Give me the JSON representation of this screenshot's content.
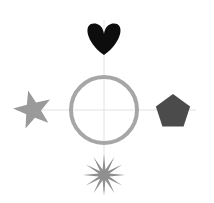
{
  "canvas": {
    "width": 214,
    "height": 203,
    "background": "#ffffff"
  },
  "axes": {
    "center": {
      "x": 104,
      "y": 110
    },
    "color": "#e2e2e2",
    "stroke_width": 1,
    "horizontal": {
      "x1": 16,
      "y1": 110,
      "x2": 196,
      "y2": 110
    },
    "vertical": {
      "x1": 104,
      "y1": 20,
      "x2": 104,
      "y2": 192
    }
  },
  "center_circle": {
    "name": "circle",
    "cx": 104,
    "cy": 110,
    "r": 33,
    "stroke": "#a6a6a6",
    "stroke_width": 4,
    "fill": "none"
  },
  "shapes": [
    {
      "id": "north",
      "name": "heart",
      "position": "top",
      "cx": 104,
      "cy": 38,
      "size": 36,
      "color": "#0d0d0d",
      "rotation": 0
    },
    {
      "id": "west",
      "name": "star-5-point",
      "position": "left",
      "cx": 33,
      "cy": 110,
      "size": 40,
      "color": "#9a9a9a",
      "rotation": -14
    },
    {
      "id": "east",
      "name": "pentagon",
      "position": "right",
      "cx": 173,
      "cy": 112,
      "size": 36,
      "color": "#4b4b4b",
      "rotation": 0
    },
    {
      "id": "south",
      "name": "starburst-12-point",
      "position": "bottom",
      "cx": 104,
      "cy": 175,
      "size": 42,
      "color": "#8f8f8f",
      "rotation": 0
    }
  ]
}
